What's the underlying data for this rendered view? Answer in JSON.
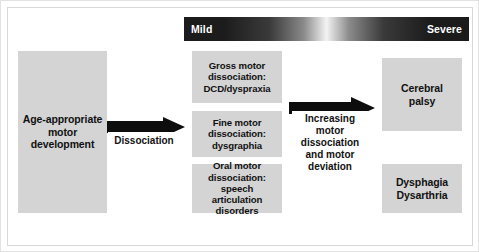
{
  "figure": {
    "severity_scale": {
      "mild_label": "Mild",
      "severe_label": "Severe",
      "gradient_from": "#1b1b1b",
      "gradient_mid": "#f3f3f3",
      "gradient_to": "#1b1b1b"
    },
    "box_fill": "#d4d4d4",
    "text_color": "#111111",
    "start_box": {
      "line1": "Age-appropriate",
      "line2": "motor",
      "line3": "development"
    },
    "arrow_one": {
      "caption": "Dissociation"
    },
    "middle_boxes": [
      {
        "name": "gross-motor",
        "line1": "Gross motor",
        "line2": "dissociation:",
        "line3": "DCD/dyspraxia"
      },
      {
        "name": "fine-motor",
        "line1": "Fine motor",
        "line2": "dissociation:",
        "line3": "dysgraphia"
      },
      {
        "name": "oral-motor",
        "line1": "Oral motor",
        "line2": "dissociation:",
        "line3": "speech",
        "line4": "articulation",
        "line5": "disorders"
      }
    ],
    "arrow_two": {
      "caption_line1": "Increasing",
      "caption_line2": "motor",
      "caption_line3": "dissociation",
      "caption_line4": "and",
      "caption_line5": "motor",
      "caption_line6": "deviation"
    },
    "outcome_boxes": [
      {
        "name": "cerebral-palsy",
        "line1": "Cerebral",
        "line2": "palsy"
      },
      {
        "name": "dysphagia-dysarthria",
        "line1": "Dysphagia",
        "line2": "Dysarthria"
      }
    ]
  }
}
